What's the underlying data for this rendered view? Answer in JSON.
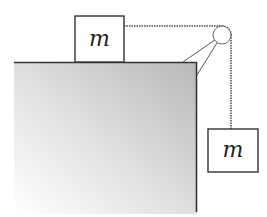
{
  "diagram": {
    "blocks": [
      {
        "id": "table-block",
        "label": "m",
        "x": 75,
        "y": 16,
        "w": 49,
        "h": 46
      },
      {
        "id": "hanging-block",
        "label": "m",
        "x": 208,
        "y": 129,
        "w": 50,
        "h": 43
      }
    ],
    "table": {
      "x": 14,
      "y": 62,
      "w": 183,
      "h": 150,
      "gradient_dark": "#bdbdbd",
      "gradient_light": "#ffffff",
      "edge_color": "#333333"
    },
    "pulley": {
      "cx": 222,
      "cy": 35,
      "r": 9
    },
    "rope": {
      "color": "#777777",
      "style": "braided"
    },
    "stroke_color": "#444444"
  }
}
